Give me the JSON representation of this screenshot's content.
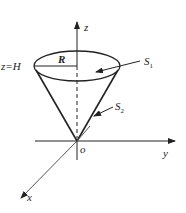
{
  "diagram": {
    "type": "3d-cone-surface",
    "colors": {
      "stroke": "#222222",
      "background": "#ffffff",
      "axis_x": "#555555"
    },
    "axes": {
      "z": {
        "label": "z"
      },
      "y": {
        "label": "y"
      },
      "x": {
        "label": "x"
      },
      "origin": {
        "label": "o"
      }
    },
    "labels": {
      "height": "z=H",
      "radius": "R",
      "s1_main": "S",
      "s1_sub": "1",
      "s2_main": "S",
      "s2_sub": "2"
    }
  }
}
